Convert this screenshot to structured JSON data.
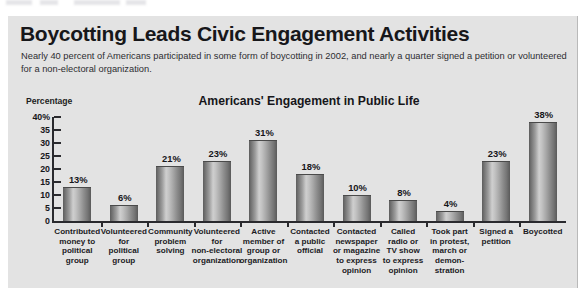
{
  "headline": "Boycotting Leads Civic Engagement Activities",
  "subtitle": "Nearly 40 percent of Americans participated in some form of boycotting in 2002, and nearly a quarter signed a petition or volunteered for a non-electoral organization.",
  "axis_unit_label": "Percentage",
  "colors": {
    "page_background": "#ffffff",
    "panel_background": "#e3e3e3",
    "axis": "#2a2a2e",
    "text": "#16161a",
    "bar_light": "#cfcfcf",
    "bar_dark": "#5a5a5a"
  },
  "chart_data": {
    "type": "bar",
    "title": "Americans' Engagement in Public Life",
    "xlabel": "",
    "ylabel": "Percentage",
    "ylim": [
      0,
      40
    ],
    "grid": false,
    "legend": false,
    "value_suffix": "%",
    "ytick_labels": [
      "40%",
      "35",
      "30",
      "25",
      "20",
      "15",
      "10",
      "5",
      "0"
    ],
    "ytick_values": [
      40,
      35,
      30,
      25,
      20,
      15,
      10,
      5,
      0
    ],
    "categories": [
      "Contributed money to political group",
      "Volunteered for political group",
      "Community problem solving",
      "Volunteered for non-electoral organization",
      "Active member of group or organization",
      "Contacted a public official",
      "Contacted newspaper or magazine to express opinion",
      "Called radio or TV show to express opinion",
      "Took part in protest, march or demon-stration",
      "Signed a petition",
      "Boycotted"
    ],
    "category_lines": [
      [
        "Contributed",
        "money to",
        "political",
        "group"
      ],
      [
        "Volunteered",
        "for",
        "political",
        "group"
      ],
      [
        "Community",
        "problem",
        "solving"
      ],
      [
        "Volunteered",
        "for",
        "non-electoral",
        "organization"
      ],
      [
        "Active",
        "member of",
        "group or",
        "organization"
      ],
      [
        "Contacted",
        "a public",
        "official"
      ],
      [
        "Contacted",
        "newspaper",
        "or magazine",
        "to express",
        "opinion"
      ],
      [
        "Called",
        "radio or",
        "TV show",
        "to express",
        "opinion"
      ],
      [
        "Took part",
        "in protest,",
        "march or",
        "demon-",
        "stration"
      ],
      [
        "Signed a",
        "petition"
      ],
      [
        "Boycotted"
      ]
    ],
    "values": [
      13,
      6,
      21,
      23,
      31,
      18,
      10,
      8,
      4,
      23,
      38
    ],
    "value_labels": [
      "13%",
      "6%",
      "21%",
      "23%",
      "31%",
      "18%",
      "10%",
      "8%",
      "4%",
      "23%",
      "38%"
    ]
  }
}
